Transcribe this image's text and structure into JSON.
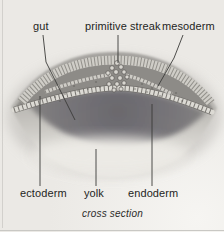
{
  "diagram": {
    "labels": {
      "gut": "gut",
      "primitive_streak": "primitive streak",
      "mesoderm": "mesoderm",
      "ectoderm": "ectoderm",
      "yolk": "yolk",
      "endoderm": "endoderm"
    },
    "caption": "cross section"
  },
  "colors": {
    "background": "#ebe9e5",
    "label_ink": "#1f1f1d",
    "leader_line": "#3b3b39",
    "dome_gray": "#8d8b87",
    "gut_cavity_gray": "#68666b",
    "yolk_light": "#dcdad5",
    "cell_fill": "#dcdad4",
    "cell_outline": "#55534f"
  }
}
